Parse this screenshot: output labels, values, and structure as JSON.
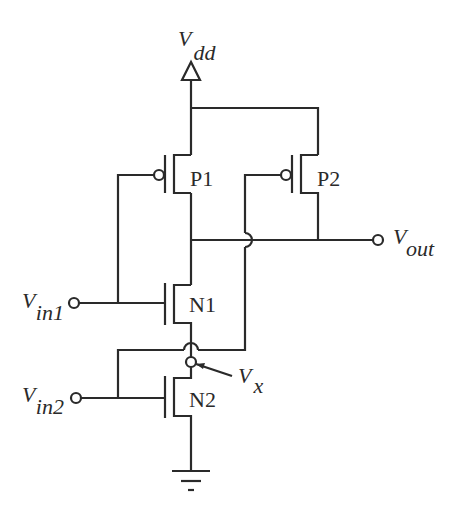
{
  "diagram": {
    "type": "CMOS circuit schematic (2-input NOR-like with hop-over crossings)",
    "supply": {
      "symbol": "V",
      "subscript": "dd"
    },
    "ground": {
      "symbol": "ground"
    },
    "transistors": [
      {
        "name": "P1",
        "type": "PMOS"
      },
      {
        "name": "P2",
        "type": "PMOS"
      },
      {
        "name": "N1",
        "type": "NMOS"
      },
      {
        "name": "N2",
        "type": "NMOS"
      }
    ],
    "terminals": {
      "vin1": {
        "symbol": "V",
        "subscript": "in1"
      },
      "vin2": {
        "symbol": "V",
        "subscript": "in2"
      },
      "vout": {
        "symbol": "V",
        "subscript": "out"
      },
      "vx": {
        "symbol": "V",
        "subscript": "x"
      }
    }
  }
}
